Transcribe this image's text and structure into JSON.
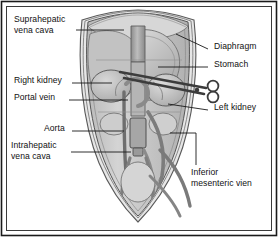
{
  "figure": {
    "kind": "anatomical-diagram",
    "orientation": "anterior view, shield-shaped abdominal outline",
    "palette": {
      "background": "#ffffff",
      "border": "#1a1a1a",
      "ink": "#111111",
      "outline_stroke": "#4a4a4a",
      "body_fill": "#c9c9c9",
      "body_fill_light": "#dcdcdc",
      "organ_fill": "#b4b4b4",
      "organ_fill_light": "#d2d2d2",
      "vessel_fill": "#8f8f8f",
      "vessel_stroke": "#5a5a5a",
      "cannula_fill": "#a8a8a8",
      "instrument_stroke": "#3c3c3c",
      "leader_line": "#1a1a1a"
    }
  },
  "labels": {
    "left": [
      {
        "id": "suprahepatic-vena-cava",
        "lines": [
          "Suprahepatic",
          "vena cava"
        ],
        "x": 14,
        "y": 14
      },
      {
        "id": "right-kidney",
        "lines": [
          "Right kidney"
        ],
        "x": 14,
        "y": 75
      },
      {
        "id": "portal-vein",
        "lines": [
          "Portal vein"
        ],
        "x": 14,
        "y": 92
      },
      {
        "id": "aorta",
        "lines": [
          "Aorta"
        ],
        "x": 44,
        "y": 123
      },
      {
        "id": "intrahepatic-vena-cava",
        "lines": [
          "Intrahepatic",
          "vena cava"
        ],
        "x": 11,
        "y": 140
      }
    ],
    "right": [
      {
        "id": "diaphragm",
        "lines": [
          "Diaphragm"
        ],
        "x": 214,
        "y": 41
      },
      {
        "id": "stomach",
        "lines": [
          "Stomach"
        ],
        "x": 214,
        "y": 59
      },
      {
        "id": "left-kidney",
        "lines": [
          "Left kidney"
        ],
        "x": 214,
        "y": 102
      },
      {
        "id": "inferior-mesenteric-vein",
        "lines": [
          "Inferior",
          "mesenteric vien"
        ],
        "x": 191,
        "y": 167
      }
    ]
  },
  "structures": [
    "diaphragm",
    "stomach",
    "right-kidney",
    "left-kidney",
    "portal-vein",
    "aorta",
    "suprahepatic-vena-cava",
    "intrahepatic-vena-cava",
    "inferior-mesenteric-vein",
    "surgical-scissors"
  ]
}
